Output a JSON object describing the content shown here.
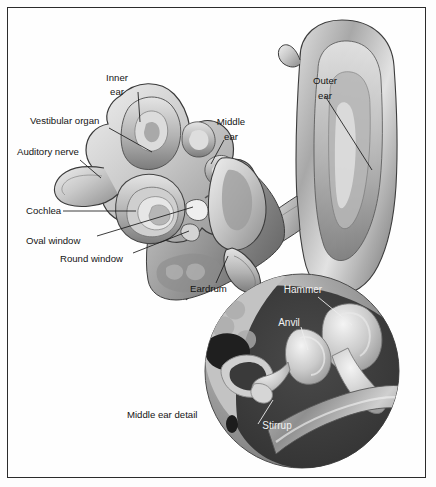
{
  "figure": {
    "background_color": "#fdfdfd",
    "frame_color": "#2b2b2b",
    "label_color": "#141414",
    "inset_label_color": "#f2f2f2"
  },
  "labels": {
    "inner_ear_line1": "Inner",
    "inner_ear_line2": "ear",
    "vestibular_organ": "Vestibular organ",
    "auditory_nerve": "Auditory nerve",
    "cochlea": "Cochlea",
    "oval_window": "Oval window",
    "round_window": "Round window",
    "middle_ear_line1": "Middle",
    "middle_ear_line2": "ear",
    "outer_ear_line1": "Outer",
    "outer_ear_line2": "ear",
    "eardrum": "Eardrum",
    "middle_ear_detail": "Middle ear detail"
  },
  "inset_labels": {
    "hammer": "Hammer",
    "anvil": "Anvil",
    "stirrup": "Stirrup"
  },
  "structures": [
    {
      "name": "inner-ear",
      "label": "Inner ear"
    },
    {
      "name": "vestibular-organ",
      "label": "Vestibular organ"
    },
    {
      "name": "auditory-nerve",
      "label": "Auditory nerve"
    },
    {
      "name": "cochlea",
      "label": "Cochlea"
    },
    {
      "name": "oval-window",
      "label": "Oval window"
    },
    {
      "name": "round-window",
      "label": "Round window"
    },
    {
      "name": "middle-ear",
      "label": "Middle ear"
    },
    {
      "name": "outer-ear",
      "label": "Outer ear"
    },
    {
      "name": "eardrum",
      "label": "Eardrum"
    },
    {
      "name": "hammer",
      "label": "Hammer"
    },
    {
      "name": "anvil",
      "label": "Anvil"
    },
    {
      "name": "stirrup",
      "label": "Stirrup"
    }
  ]
}
